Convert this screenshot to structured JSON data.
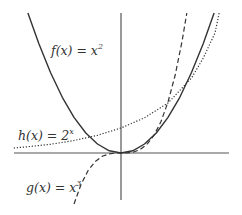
{
  "chart_data": {
    "type": "line",
    "title": "",
    "xlabel": "",
    "ylabel": "",
    "grid": false,
    "axes": {
      "origin_px": [
        121,
        153
      ],
      "x_axis_px": [
        14,
        229
      ],
      "y_axis_px": [
        13,
        200
      ]
    },
    "scale": {
      "px_per_unit_x": 47,
      "px_per_unit_y": 25
    },
    "xlim": [
      -2.3,
      2.3
    ],
    "ylim": [
      -1.9,
      5.6
    ],
    "series": [
      {
        "name": "f(x) = x^2",
        "label": "f(x) = x",
        "label_sup": "2",
        "style": "solid",
        "color": "#333333",
        "x": [
          -1.98,
          -1.75,
          -1.5,
          -1.25,
          -1.0,
          -0.75,
          -0.5,
          -0.25,
          0,
          0.25,
          0.5,
          0.75,
          1.0,
          1.25,
          1.5,
          1.75,
          1.98
        ],
        "y": [
          5.6,
          4.38,
          3.22,
          2.23,
          1.43,
          0.8,
          0.36,
          0.09,
          0,
          0.09,
          0.36,
          0.8,
          1.43,
          2.23,
          3.22,
          4.38,
          5.6
        ]
      },
      {
        "name": "g(x) = x^3",
        "label": "g(x) = x",
        "label_sup": "3",
        "style": "dashed",
        "color": "#333333",
        "x": [
          -1.0,
          -0.85,
          -0.7,
          -0.55,
          -0.4,
          -0.25,
          -0.1,
          0,
          0.1,
          0.25,
          0.4,
          0.55,
          0.7,
          0.85,
          1.0,
          1.15,
          1.3,
          1.4
        ],
        "y": [
          -2.04,
          -1.25,
          -0.7,
          -0.34,
          -0.13,
          -0.03,
          0,
          0,
          0,
          0.03,
          0.13,
          0.34,
          0.7,
          1.25,
          2.04,
          3.1,
          4.48,
          5.6
        ]
      },
      {
        "name": "h(x) = 2^x",
        "label": "h(x) = 2",
        "label_sup": "x",
        "style": "dotted",
        "color": "#333333",
        "x": [
          -2.28,
          -2.0,
          -1.5,
          -1.0,
          -0.5,
          0,
          0.5,
          1.0,
          1.5,
          1.75,
          2.0,
          2.09
        ],
        "y": [
          0.2,
          0.25,
          0.35,
          0.5,
          0.71,
          1.0,
          1.41,
          2.0,
          3.0,
          3.8,
          4.8,
          5.6
        ]
      }
    ],
    "annotations": [
      {
        "text": "f(x) = x^2",
        "pos_px": [
          51,
          52
        ]
      },
      {
        "text": "h(x) = 2^x",
        "pos_px": [
          18,
          135
        ]
      },
      {
        "text": "g(x) = x^3",
        "pos_px": [
          26,
          188
        ]
      }
    ]
  },
  "labels": {
    "f": {
      "main": "f(x) = x",
      "sup": "2"
    },
    "h": {
      "main": "h(x) = 2",
      "sup": "x"
    },
    "g": {
      "main": "g(x) = x",
      "sup": "3"
    }
  }
}
